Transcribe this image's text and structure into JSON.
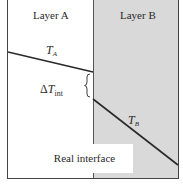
{
  "diagram": {
    "layers": [
      {
        "name": "Layer A",
        "fill": "#ffffff"
      },
      {
        "name": "Layer B",
        "fill": "#d9d9d9"
      }
    ],
    "temperature_labels": {
      "ta": {
        "symbol": "T",
        "subscript": "A"
      },
      "tb": {
        "symbol": "T",
        "subscript": "B"
      },
      "delta": {
        "prefix": "Δ",
        "symbol": "T",
        "subscript": "int"
      }
    },
    "interface_label": "Real interface",
    "colors": {
      "line": "#2a2a2a",
      "layer_b_fill": "#d9d9d9",
      "border": "#444444"
    },
    "lines": {
      "ta": {
        "x1": 8,
        "y1": 52,
        "x2": 93,
        "y2": 72
      },
      "tb": {
        "x1": 93,
        "y1": 99,
        "x2": 178,
        "y2": 165
      }
    }
  }
}
